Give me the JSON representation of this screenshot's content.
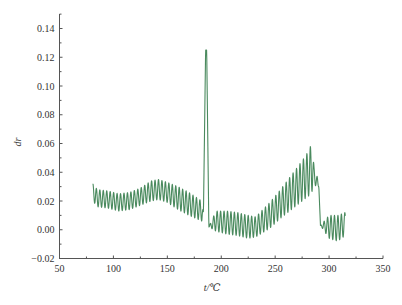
{
  "chart_data": {
    "type": "line",
    "title": "",
    "xlabel": "t/℃",
    "ylabel": "dr",
    "xlim": [
      50,
      350
    ],
    "ylim": [
      -0.02,
      0.15
    ],
    "xticks": [
      50,
      100,
      150,
      200,
      250,
      300,
      350
    ],
    "xtick_labels": [
      "50",
      "100",
      "150",
      "200",
      "250",
      "300",
      "350"
    ],
    "yticks": [
      -0.02,
      0.0,
      0.02,
      0.04,
      0.06,
      0.08,
      0.1,
      0.12,
      0.14
    ],
    "ytick_labels": [
      "−0.02",
      "0.00",
      "0.02",
      "0.04",
      "0.06",
      "0.08",
      "0.10",
      "0.12",
      "0.14"
    ],
    "grid": false,
    "legend": "none",
    "series": [
      {
        "name": "dr",
        "color": "#4a8a5e",
        "oscillation_period": 3.2,
        "envelope": {
          "x": [
            81,
            85,
            95,
            105,
            115,
            125,
            135,
            142,
            150,
            160,
            170,
            182,
            183.5,
            185.5,
            186.5,
            188.5,
            195,
            205,
            215,
            225,
            232,
            245,
            255,
            265,
            275,
            282,
            284,
            286,
            289,
            290.5,
            292,
            300,
            308,
            315
          ],
          "mean": [
            0.026,
            0.022,
            0.021,
            0.019,
            0.02,
            0.023,
            0.027,
            0.028,
            0.026,
            0.022,
            0.018,
            0.013,
            0.012,
            0.125,
            0.125,
            0.002,
            0.006,
            0.005,
            0.004,
            0.002,
            0.002,
            0.01,
            0.018,
            0.026,
            0.034,
            0.04,
            0.044,
            0.038,
            0.033,
            0.03,
            0.003,
            0.002,
            0.001,
            0.004
          ],
          "amplitude": [
            0.006,
            0.006,
            0.006,
            0.006,
            0.006,
            0.006,
            0.007,
            0.007,
            0.007,
            0.008,
            0.008,
            0.007,
            0.0,
            0.0,
            0.0,
            0.0,
            0.007,
            0.008,
            0.008,
            0.008,
            0.007,
            0.009,
            0.01,
            0.012,
            0.014,
            0.016,
            0.018,
            0.006,
            0.004,
            0.0,
            0.0,
            0.008,
            0.009,
            0.008
          ]
        }
      }
    ]
  }
}
